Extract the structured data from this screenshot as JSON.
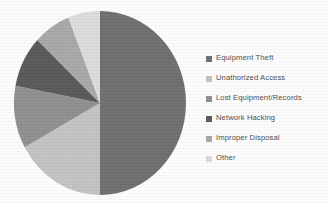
{
  "background_color": "#fdfdfd",
  "legend": {
    "position": "right",
    "items": [
      {
        "label": "Equipment Theft",
        "swatch_icon": "legend-square-icon",
        "color": "#6e6e6e"
      },
      {
        "label": "Unathorized Access",
        "swatch_icon": "legend-square-icon",
        "color": "#c3c3c3"
      },
      {
        "label": "Lost Equipment/Records",
        "swatch_icon": "legend-square-icon",
        "color": "#8f8f8f"
      },
      {
        "label": "Network Hacking",
        "swatch_icon": "legend-square-icon",
        "color": "#585858"
      },
      {
        "label": "Improper Disposal",
        "swatch_icon": "legend-square-icon",
        "color": "#a8a8a8"
      },
      {
        "label": "Other",
        "swatch_icon": "legend-square-icon",
        "color": "#dcdcdc"
      }
    ]
  },
  "chart_data": {
    "type": "pie",
    "title": "",
    "xlabel": "",
    "ylabel": "",
    "grid": false,
    "legend_position": "right",
    "start_angle_deg": 0,
    "direction": "clockwise",
    "categories": [
      "Equipment Theft",
      "Unathorized Access",
      "Lost Equipment/Records",
      "Network Hacking",
      "Improper Disposal",
      "Other"
    ],
    "values": [
      50,
      17,
      11,
      9,
      7,
      6
    ],
    "value_unit": "percent",
    "colors": [
      "#6e6e6e",
      "#c3c3c3",
      "#8f8f8f",
      "#585858",
      "#a8a8a8",
      "#dcdcdc"
    ],
    "data_labels_shown": false,
    "geometry": {
      "center_x": 100,
      "center_y": 103,
      "radius_x": 86,
      "radius_y": 92
    }
  }
}
